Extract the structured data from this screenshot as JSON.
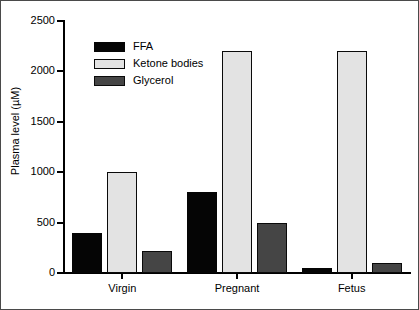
{
  "chart_data": {
    "type": "bar",
    "title": "",
    "subtitle": "",
    "xlabel": "",
    "ylabel": "Plasma level (µM)",
    "categories": [
      "Virgin",
      "Pregnant",
      "Fetus"
    ],
    "series": [
      {
        "name": "FFA",
        "color": "#050505",
        "values": [
          400,
          800,
          50
        ]
      },
      {
        "name": "Ketone bodies",
        "color": "#e3e3e3",
        "values": [
          1000,
          2200,
          2200
        ]
      },
      {
        "name": "Glycerol",
        "color": "#454545",
        "values": [
          220,
          500,
          100
        ]
      }
    ],
    "ylim": [
      0,
      2500
    ],
    "yticks": [
      0,
      500,
      1000,
      1500,
      2000,
      2500
    ],
    "ytick_labels": [
      "0",
      "500",
      "1000",
      "1500",
      "2000",
      "2500"
    ],
    "grid": false,
    "legend_position": "upper-left-inside",
    "legend_entries": [
      "FFA",
      "Ketone bodies",
      "Glycerol"
    ],
    "axis_color": "#000000",
    "background": "#ffffff"
  }
}
